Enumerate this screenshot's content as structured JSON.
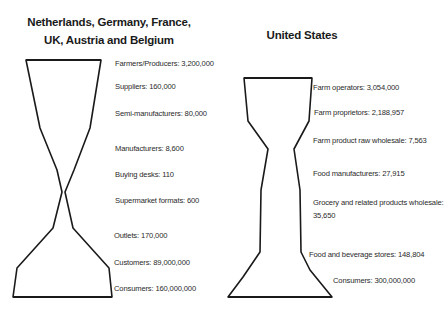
{
  "left_panel": {
    "title_line1": "Netherlands, Germany, France,",
    "title_line2": "UK, Austria and Belgium",
    "stages": [
      {
        "label": "Farmers/Producers: 3,200,000",
        "name": "Farmers/Producers",
        "value": 3200000
      },
      {
        "label": "Suppliers: 160,000",
        "name": "Suppliers",
        "value": 160000
      },
      {
        "label": "Semi-manufacturers: 80,000",
        "name": "Semi-manufacturers",
        "value": 80000
      },
      {
        "label": "Manufacturers: 8,600",
        "name": "Manufacturers",
        "value": 8600
      },
      {
        "label": "Buying desks: 110",
        "name": "Buying desks",
        "value": 110
      },
      {
        "label": "Supermarket formats: 600",
        "name": "Supermarket formats",
        "value": 600
      },
      {
        "label": "Outlets: 170,000",
        "name": "Outlets",
        "value": 170000
      },
      {
        "label": "Customers: 89,000,000",
        "name": "Customers",
        "value": 89000000
      },
      {
        "label": "Consumers: 160,000,000",
        "name": "Consumers",
        "value": 160000000
      }
    ]
  },
  "right_panel": {
    "title": "United States",
    "stages": [
      {
        "label": "Farm operators: 3,054,000",
        "name": "Farm operators",
        "value": 3054000
      },
      {
        "label": "Farm proprietors: 2,188,957",
        "name": "Farm proprietors",
        "value": 2188957
      },
      {
        "label": "Farm product raw wholesale: 7,563",
        "name": "Farm product raw wholesale",
        "value": 7563
      },
      {
        "label": "Food manufacturers: 27,915",
        "name": "Food manufacturers",
        "value": 27915
      },
      {
        "label_line1": "Grocery and related products wholesale:",
        "label_line2": "35,650",
        "name": "Grocery and related products wholesale",
        "value": 35650
      },
      {
        "label": "Food and beverage stores: 148,804",
        "name": "Food and beverage stores",
        "value": 148804
      },
      {
        "label": "Consumers: 300,000,000",
        "name": "Consumers",
        "value": 300000000
      }
    ]
  },
  "colors": {
    "outline": "#1a1a1a",
    "background": "#ffffff",
    "text": "#2a2a2a"
  }
}
